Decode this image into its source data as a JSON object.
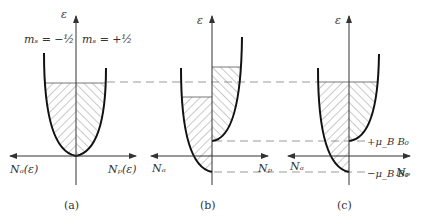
{
  "figure": {
    "panels": [
      {
        "id": "a",
        "caption": "(a)",
        "y_axis_label": "ε",
        "x_left_label": "Nₐ(ε)",
        "x_right_label": "Nₚ(ε)",
        "spin_left_label": "mₛ = −½",
        "spin_right_label": "mₛ = +½"
      },
      {
        "id": "b",
        "caption": "(b)",
        "y_axis_label": "ε",
        "x_left_label": "Nₐ",
        "x_right_label": "Nₚ"
      },
      {
        "id": "c",
        "caption": "(c)",
        "y_axis_label": "ε",
        "x_left_label": "Nₐ",
        "x_right_label": "Nₚ",
        "upper_level_label": "+μ_B B₀",
        "lower_level_label": "−μ_B B₀"
      }
    ],
    "colors": {
      "ink": "#222222",
      "dashed": "#999999",
      "hatch": "#777777"
    }
  }
}
